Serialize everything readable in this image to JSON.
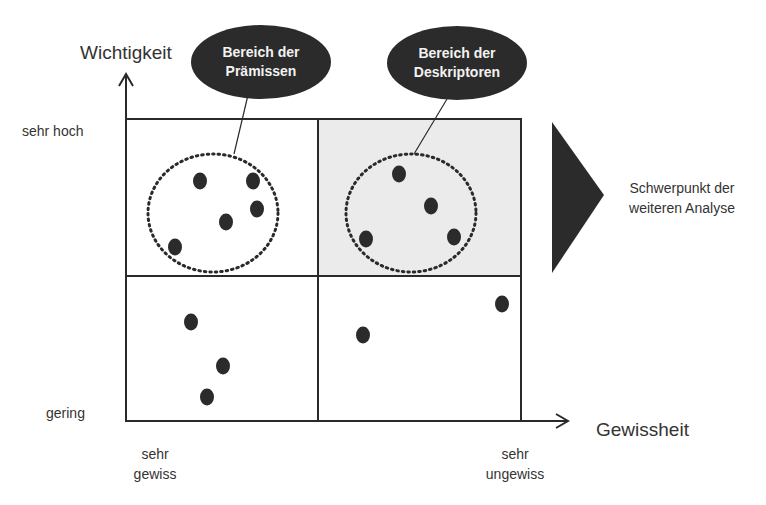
{
  "axes": {
    "y_title": "Wichtigkeit",
    "x_title": "Gewissheit",
    "y_high": "sehr hoch",
    "y_low": "gering",
    "x_low_line1": "sehr",
    "x_low_line2": "gewiss",
    "x_high_line1": "sehr",
    "x_high_line2": "ungewiss"
  },
  "callouts": {
    "premises_line1": "Bereich der",
    "premises_line2": "Prämissen",
    "descriptors_line1": "Bereich der",
    "descriptors_line2": "Deskriptoren"
  },
  "focus": {
    "line1": "Schwerpunkt der",
    "line2": "weiteren Analyse"
  },
  "colors": {
    "dot": "#2b2b2b",
    "bubble": "#2b2b2b",
    "highlight_quadrant": "#ebebeb",
    "line": "#2a2a2a"
  },
  "quadrants": [
    {
      "name": "top-left",
      "label": "Bereich der Prämissen",
      "points": [
        [
          200,
          181
        ],
        [
          253,
          181
        ],
        [
          257,
          209
        ],
        [
          226,
          222
        ],
        [
          175,
          247
        ]
      ]
    },
    {
      "name": "top-right",
      "label": "Bereich der Deskriptoren",
      "points": [
        [
          399,
          174
        ],
        [
          431,
          206
        ],
        [
          366,
          239
        ],
        [
          454,
          237
        ]
      ]
    },
    {
      "name": "bottom-left",
      "points": [
        [
          191,
          322
        ],
        [
          223,
          366
        ],
        [
          207,
          397
        ]
      ]
    },
    {
      "name": "bottom-right",
      "points": [
        [
          502,
          304
        ],
        [
          363,
          335
        ]
      ]
    }
  ]
}
